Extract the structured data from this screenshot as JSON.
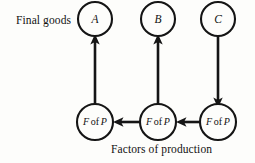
{
  "figure": {
    "type": "flow-diagram",
    "background_color": "#fdfdfb",
    "ink_color": "#151515",
    "labels": {
      "final_goods": "Final goods",
      "factors_of_production": "Factors of production"
    },
    "nodes": {
      "upper": [
        {
          "id": "A",
          "label": "A",
          "cx": 95,
          "cy": 19,
          "r": 17
        },
        {
          "id": "B",
          "label": "B",
          "cx": 158,
          "cy": 19,
          "r": 17
        },
        {
          "id": "C",
          "label": "C",
          "cx": 218,
          "cy": 19,
          "r": 17
        }
      ],
      "lower": [
        {
          "id": "fop-left",
          "label_part1": "F",
          "label_part2": "of",
          "label_part3": "P",
          "cx": 95,
          "cy": 122,
          "r": 18
        },
        {
          "id": "fop-middle",
          "label_part1": "F",
          "label_part2": "of",
          "label_part3": "P",
          "cx": 158,
          "cy": 122,
          "r": 18
        },
        {
          "id": "fop-right",
          "label_part1": "F",
          "label_part2": "of",
          "label_part3": "P",
          "cx": 218,
          "cy": 122,
          "r": 18
        }
      ]
    },
    "edges": [
      {
        "id": "edge-fop-left-to-A",
        "from": "fop-left",
        "to": "A",
        "direction": "up"
      },
      {
        "id": "edge-fop-middle-to-B",
        "from": "fop-middle",
        "to": "B",
        "direction": "up"
      },
      {
        "id": "edge-C-to-fop-right",
        "from": "C",
        "to": "fop-right",
        "direction": "down"
      },
      {
        "id": "edge-fop-middle-to-fop-left",
        "from": "fop-middle",
        "to": "fop-left",
        "direction": "left"
      },
      {
        "id": "edge-fop-right-to-fop-middle",
        "from": "fop-right",
        "to": "fop-middle",
        "direction": "left"
      }
    ]
  }
}
